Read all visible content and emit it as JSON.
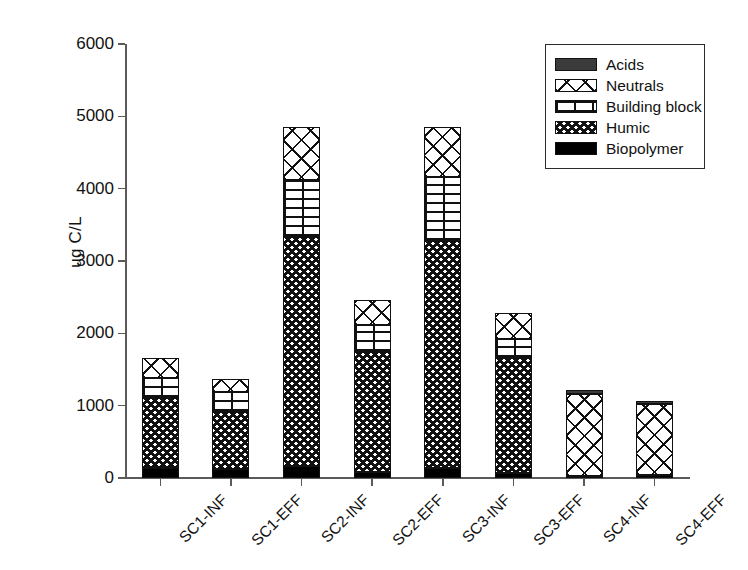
{
  "chart_data": {
    "type": "bar",
    "subtype": "stacked-bar",
    "title": "",
    "xlabel": "",
    "ylabel": "ug C/L",
    "ylim": [
      0,
      6000
    ],
    "yticks": [
      0,
      1000,
      2000,
      3000,
      4000,
      5000,
      6000
    ],
    "grid": false,
    "legend_position": "top-right",
    "categories": [
      "SC1-INF",
      "SC1-EFF",
      "SC2-INF",
      "SC2-EFF",
      "SC3-INF",
      "SC3-EFF",
      "SC4-INF",
      "SC4-EFF"
    ],
    "series": [
      {
        "name": "Biopolymer",
        "pattern": "solid-black",
        "values": [
          140,
          120,
          165,
          80,
          140,
          70,
          25,
          45
        ]
      },
      {
        "name": "Humic",
        "pattern": "checkerboard",
        "values": [
          965,
          795,
          3170,
          1665,
          3135,
          1590,
          0,
          0
        ]
      },
      {
        "name": "Building block",
        "pattern": "brick-horizontal",
        "values": [
          280,
          275,
          785,
          370,
          885,
          265,
          0,
          0
        ]
      },
      {
        "name": "Neutrals",
        "pattern": "diamond-crosshatch",
        "values": [
          275,
          180,
          735,
          345,
          695,
          360,
          1140,
          985
        ]
      },
      {
        "name": "Acids",
        "pattern": "solid-dark-gray",
        "values": [
          0,
          0,
          0,
          0,
          0,
          0,
          45,
          35
        ]
      }
    ],
    "totals": [
      1660,
      1370,
      4855,
      2460,
      4855,
      2285,
      1210,
      1065
    ]
  },
  "legend": {
    "items": [
      {
        "label": "Acids",
        "swatch": "acids-swatch"
      },
      {
        "label": "Neutrals",
        "swatch": "neutrals-swatch"
      },
      {
        "label": "Building block",
        "swatch": "building-block-swatch"
      },
      {
        "label": "Humic",
        "swatch": "humic-swatch"
      },
      {
        "label": "Biopolymer",
        "swatch": "biopolymer-swatch"
      }
    ]
  },
  "colors": {
    "axis": "#5a5a5a",
    "ink": "#111111",
    "background": "#ffffff",
    "acids": "#3b3b3b",
    "biopolymer": "#000000"
  }
}
